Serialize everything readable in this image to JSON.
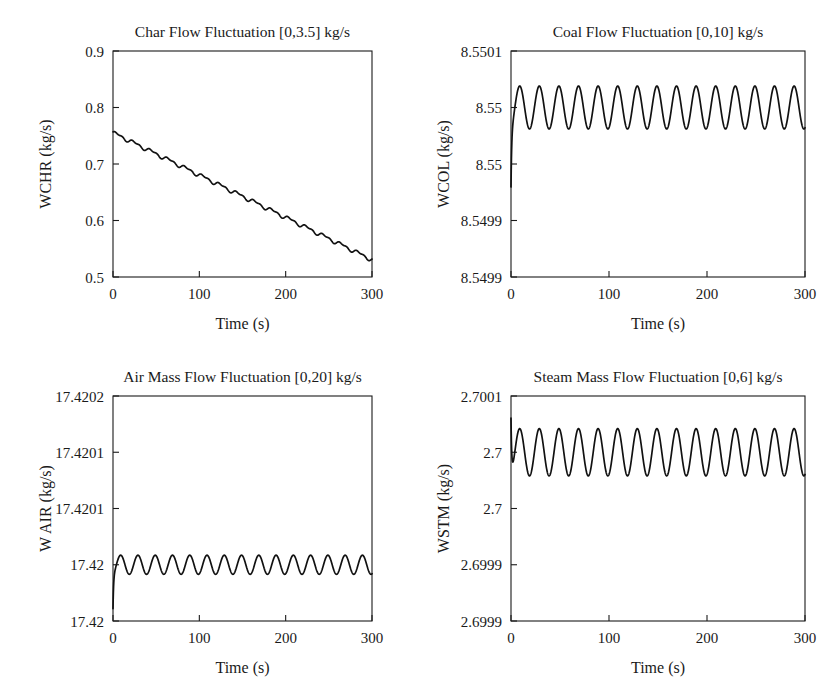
{
  "figure": {
    "background": "#ffffff",
    "ink": "#1a1a1a",
    "panel_count": 4
  },
  "chart_data": [
    {
      "id": "char-flow",
      "type": "line",
      "title": "Char Flow Fluctuation [0,3.5] kg/s",
      "xlabel": "Time (s)",
      "ylabel": "WCHR (kg/s)",
      "xlim": [
        0,
        300
      ],
      "ylim": [
        0.5,
        0.9
      ],
      "xticks": [
        0,
        100,
        200,
        300
      ],
      "xticklabels": [
        "0",
        "100",
        "200",
        "300"
      ],
      "yticks": [
        0.5,
        0.6,
        0.7,
        0.8,
        0.9
      ],
      "yticklabels": [
        "0.5",
        "0.6",
        "0.7",
        "0.8",
        "0.9"
      ],
      "grid": false,
      "legend": null,
      "waveform": "ramp-with-ripple",
      "start_value": 0.7555,
      "end_value": 0.5305,
      "ripple_amplitude": 0.0045,
      "ripple_cycles": 15,
      "transient": null,
      "series": [
        {
          "name": "WCHR",
          "x": [
            0,
            20,
            40,
            60,
            80,
            100,
            120,
            140,
            160,
            180,
            200,
            220,
            240,
            260,
            280,
            300
          ],
          "values": [
            0.7555,
            0.7405,
            0.7255,
            0.7105,
            0.6955,
            0.6805,
            0.6655,
            0.6505,
            0.6355,
            0.6205,
            0.6055,
            0.5905,
            0.5755,
            0.5605,
            0.5455,
            0.5305
          ]
        }
      ]
    },
    {
      "id": "coal-flow",
      "type": "line",
      "title": "Coal Flow Fluctuation [0,10] kg/s",
      "xlabel": "Time (s)",
      "ylabel": "WCOL (kg/s)",
      "xlim": [
        0,
        300
      ],
      "ylim": [
        0,
        4
      ],
      "xticks": [
        0,
        100,
        200,
        300
      ],
      "xticklabels": [
        "0",
        "100",
        "200",
        "300"
      ],
      "yticks": [
        0,
        1,
        2,
        3,
        4
      ],
      "yticklabels": [
        "8.5499",
        "8.5499",
        "8.55",
        "8.55",
        "8.5501"
      ],
      "grid": false,
      "legend": null,
      "waveform": "sine",
      "mean_level": 3,
      "amplitude": 0.38,
      "cycles": 15,
      "transient": {
        "at": 0,
        "direction": "down",
        "extent": 1.05
      },
      "series": [
        {
          "name": "WCOL",
          "nominal": 8.55,
          "peak": 8.55,
          "trough": 8.5499
        }
      ]
    },
    {
      "id": "air-mass-flow",
      "type": "line",
      "title": "Air Mass Flow Fluctuation [0,20] kg/s",
      "xlabel": "Time (s)",
      "ylabel": "W AIR (kg/s)",
      "xlim": [
        0,
        300
      ],
      "ylim": [
        0,
        4
      ],
      "xticks": [
        0,
        100,
        200,
        300
      ],
      "xticklabels": [
        "0",
        "100",
        "200",
        "300"
      ],
      "yticks": [
        0,
        1,
        2,
        3,
        4
      ],
      "yticklabels": [
        "17.42",
        "17.42",
        "17.4201",
        "17.4201",
        "17.4202"
      ],
      "grid": false,
      "legend": null,
      "waveform": "sine",
      "mean_level": 1,
      "amplitude": 0.17,
      "cycles": 15,
      "transient": {
        "at": 0,
        "direction": "down",
        "extent": 0.62
      },
      "series": [
        {
          "name": "WAIR",
          "nominal": 17.42,
          "peak": 17.42,
          "trough": 17.42
        }
      ]
    },
    {
      "id": "steam-mass-flow",
      "type": "line",
      "title": "Steam Mass Flow Fluctuation [0,6] kg/s",
      "xlabel": "Time (s)",
      "ylabel": "WSTM (kg/s)",
      "xlim": [
        0,
        300
      ],
      "ylim": [
        0,
        4
      ],
      "xticks": [
        0,
        100,
        200,
        300
      ],
      "xticklabels": [
        "0",
        "100",
        "200",
        "300"
      ],
      "yticks": [
        0,
        1,
        2,
        3,
        4
      ],
      "yticklabels": [
        "2.6999",
        "2.6999",
        "2.7",
        "2.7",
        "2.7001"
      ],
      "grid": false,
      "legend": null,
      "waveform": "sine",
      "mean_level": 3,
      "amplitude": 0.42,
      "cycles": 15,
      "transient": {
        "at": 0,
        "direction": "up",
        "extent": 1.0
      },
      "series": [
        {
          "name": "WSTM",
          "nominal": 2.7,
          "peak": 2.70005,
          "trough": 2.69995
        }
      ]
    }
  ]
}
